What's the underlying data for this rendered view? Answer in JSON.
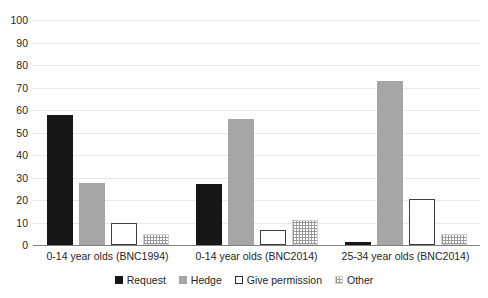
{
  "chart_data": {
    "type": "bar",
    "title": "",
    "xlabel": "",
    "ylabel": "",
    "ylim": [
      0,
      100
    ],
    "ytick_step": 10,
    "yticks": [
      100,
      90,
      80,
      70,
      60,
      50,
      40,
      30,
      20,
      10,
      0
    ],
    "grid": true,
    "legend_position": "bottom",
    "categories": [
      "0-14 year olds (BNC1994)",
      "0-14 year olds (BNC2014)",
      "25-34 year olds (BNC2014)"
    ],
    "series": [
      {
        "name": "Request",
        "color": "#161616",
        "style": "solid",
        "values": [
          58,
          27,
          1.5
        ]
      },
      {
        "name": "Hedge",
        "color": "#a6a6a6",
        "style": "solid",
        "values": [
          27.5,
          56,
          73
        ]
      },
      {
        "name": "Give permission",
        "color": "#ffffff",
        "style": "outline",
        "values": [
          10,
          6.5,
          20.5
        ]
      },
      {
        "name": "Other",
        "color": "#9a9a9a",
        "style": "dotted",
        "values": [
          5,
          11,
          5
        ]
      }
    ]
  },
  "legend": {
    "items": [
      {
        "label": "Request",
        "swatch": "request-swatch-icon"
      },
      {
        "label": "Hedge",
        "swatch": "hedge-swatch-icon"
      },
      {
        "label": "Give permission",
        "swatch": "give-permission-swatch-icon"
      },
      {
        "label": "Other",
        "swatch": "other-swatch-icon"
      }
    ]
  }
}
